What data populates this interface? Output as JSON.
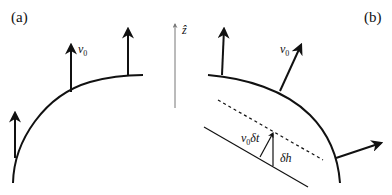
{
  "figure": {
    "panels": [
      {
        "id": "a",
        "label": "(a)",
        "arrows": [
          {
            "name": "left-arrow"
          },
          {
            "name": "middle-arrow",
            "label_main": "v",
            "label_sub": "0"
          },
          {
            "name": "right-arrow"
          }
        ],
        "axis": {
          "label": "ẑ"
        }
      },
      {
        "id": "b",
        "label": "(b)",
        "arrows": [
          {
            "name": "left-arrow"
          },
          {
            "name": "middle-arrow",
            "label_main": "v",
            "label_sub": "0"
          },
          {
            "name": "right-arrow"
          }
        ],
        "inset": {
          "displacement_label_main": "v",
          "displacement_label_sub": "0",
          "displacement_label_tail": "δt",
          "height_label": "δh"
        }
      }
    ],
    "colors": {
      "ink": "#111111",
      "axis": "#777777"
    }
  }
}
